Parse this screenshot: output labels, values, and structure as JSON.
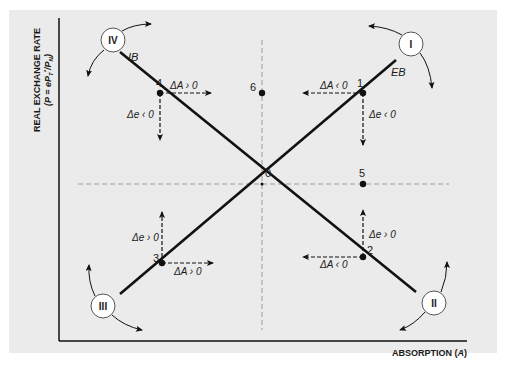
{
  "axes": {
    "y_label": "REAL EXCHANGE RATE",
    "y_formula": "(P = eP",
    "y_formula_sub": "T",
    "y_formula_sup": "*",
    "y_formula_tail": "/P",
    "y_formula_tail_sub": "N",
    "y_formula_close": ")",
    "x_label": "ABSORPTION (",
    "x_label_var": "A",
    "x_label_close": ")"
  },
  "curves": {
    "eb": {
      "label": "EB",
      "from": [
        120,
        294
      ],
      "to": [
        396,
        60
      ]
    },
    "ib": {
      "label": "IB",
      "from": [
        120,
        52
      ],
      "to": [
        416,
        292
      ]
    }
  },
  "reference_lines": {
    "horizontal": {
      "y": 184,
      "x_from": 78,
      "x_to": 449
    },
    "vertical": {
      "x": 262,
      "y_from": 40,
      "y_to": 330
    }
  },
  "points": [
    {
      "id": "0",
      "label": "0",
      "x": 262,
      "y": 184
    },
    {
      "id": "1",
      "label": "1",
      "x": 363,
      "y": 93
    },
    {
      "id": "2",
      "label": "2",
      "x": 363,
      "y": 257
    },
    {
      "id": "3",
      "label": "3",
      "x": 162,
      "y": 263
    },
    {
      "id": "4",
      "label": "4",
      "x": 160,
      "y": 93
    },
    {
      "id": "5",
      "label": "5",
      "x": 363,
      "y": 184
    },
    {
      "id": "6",
      "label": "6",
      "x": 262,
      "y": 93
    }
  ],
  "adjustments": {
    "p1": {
      "dA": "ΔA ‹ 0",
      "de": "Δe ‹ 0"
    },
    "p2": {
      "dA": "ΔA ‹ 0",
      "de": "Δe › 0"
    },
    "p3": {
      "dA": "ΔA › 0",
      "de": "Δe › 0"
    },
    "p4": {
      "dA": "ΔA › 0",
      "de": "Δe ‹ 0"
    }
  },
  "zones": [
    {
      "id": "I",
      "label": "I",
      "cx": 411,
      "cy": 44
    },
    {
      "id": "II",
      "label": "II",
      "cx": 434,
      "cy": 303
    },
    {
      "id": "III",
      "label": "III",
      "cx": 103,
      "cy": 306
    },
    {
      "id": "IV",
      "label": "IV",
      "cx": 113,
      "cy": 40
    }
  ],
  "colors": {
    "panel": "#ebebeb",
    "ink": "#111111",
    "dashed": "#999999",
    "circle_fill": "#ffffff"
  }
}
